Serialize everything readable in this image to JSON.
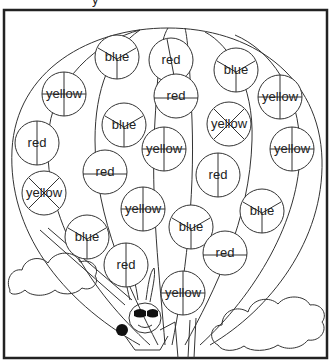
{
  "worksheet": {
    "title_fragment": "y",
    "frame": {
      "x": 4,
      "y": 10,
      "width": 323,
      "height": 348,
      "border_color": "#222222"
    },
    "balloon": {
      "circles": [
        {
          "label": "blue",
          "cx": 117,
          "cy": 57,
          "split": "y"
        },
        {
          "label": "red",
          "cx": 171,
          "cy": 60,
          "split": "diag"
        },
        {
          "label": "blue",
          "cx": 236,
          "cy": 70,
          "split": "y"
        },
        {
          "label": "yellow",
          "cx": 64,
          "cy": 94,
          "split": "cross"
        },
        {
          "label": "red",
          "cx": 176,
          "cy": 96,
          "split": "h"
        },
        {
          "label": "yellow",
          "cx": 280,
          "cy": 97,
          "split": "cross"
        },
        {
          "label": "red",
          "cx": 37,
          "cy": 143,
          "split": "v"
        },
        {
          "label": "blue",
          "cx": 124,
          "cy": 125,
          "split": "y"
        },
        {
          "label": "yellow",
          "cx": 229,
          "cy": 124,
          "split": "x"
        },
        {
          "label": "red",
          "cx": 105,
          "cy": 172,
          "split": "h"
        },
        {
          "label": "yellow",
          "cx": 164,
          "cy": 149,
          "split": "cross"
        },
        {
          "label": "yellow",
          "cx": 292,
          "cy": 149,
          "split": "cross"
        },
        {
          "label": "red",
          "cx": 218,
          "cy": 175,
          "split": "v"
        },
        {
          "label": "yellow",
          "cx": 44,
          "cy": 193,
          "split": "x"
        },
        {
          "label": "yellow",
          "cx": 143,
          "cy": 209,
          "split": "cross"
        },
        {
          "label": "blue",
          "cx": 191,
          "cy": 227,
          "split": "y"
        },
        {
          "label": "blue",
          "cx": 262,
          "cy": 211,
          "split": "y"
        },
        {
          "label": "blue",
          "cx": 87,
          "cy": 237,
          "split": "y"
        },
        {
          "label": "red",
          "cx": 225,
          "cy": 253,
          "split": "h"
        },
        {
          "label": "red",
          "cx": 126,
          "cy": 265,
          "split": "v"
        },
        {
          "label": "yellow",
          "cx": 183,
          "cy": 293,
          "split": "cross"
        }
      ]
    },
    "illustrations": [
      "hot-air-balloon",
      "cloud-left",
      "cloud-right",
      "bunny-pilot"
    ]
  }
}
